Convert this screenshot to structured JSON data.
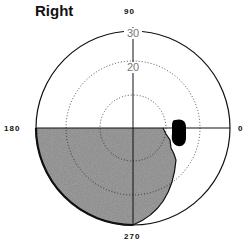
{
  "title": "Right",
  "angle_labels": {
    "top": "90",
    "left": "180",
    "right": "0",
    "bottom": "270"
  },
  "radial_labels": [
    "30",
    "20"
  ],
  "rings": [
    10,
    20,
    30
  ],
  "colors": {
    "shade": "#8c8c8c",
    "ink": "#111111",
    "spot": "#000000"
  }
}
